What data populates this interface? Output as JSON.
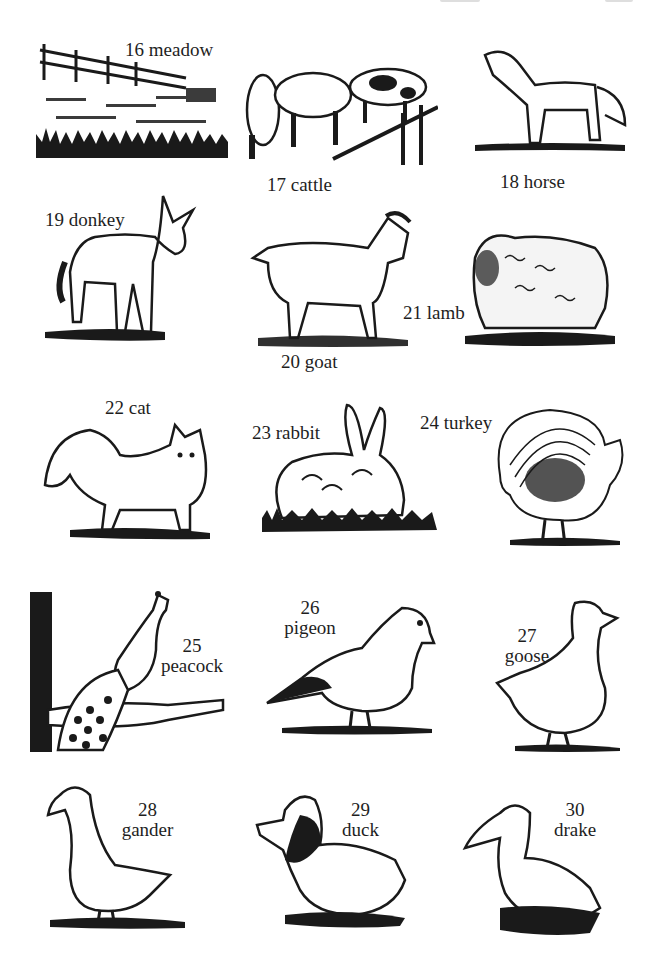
{
  "page": {
    "type": "picture dictionary page",
    "ink_color": "#1a1a1a",
    "paper_color": "#ffffff"
  },
  "items": [
    {
      "number": "16",
      "word": "meadow",
      "label": "16 meadow"
    },
    {
      "number": "17",
      "word": "cattle",
      "label": "17 cattle"
    },
    {
      "number": "18",
      "word": "horse",
      "label": "18 horse"
    },
    {
      "number": "19",
      "word": "donkey",
      "label": "19 donkey"
    },
    {
      "number": "20",
      "word": "goat",
      "label": "20 goat"
    },
    {
      "number": "21",
      "word": "lamb",
      "label": "21 lamb"
    },
    {
      "number": "22",
      "word": "cat",
      "label": "22 cat"
    },
    {
      "number": "23",
      "word": "rabbit",
      "label": "23 rabbit"
    },
    {
      "number": "24",
      "word": "turkey",
      "label": "24 turkey"
    },
    {
      "number": "25",
      "word": "peacock",
      "label": "25 peacock"
    },
    {
      "number": "26",
      "word": "pigeon",
      "label": "26 pigeon"
    },
    {
      "number": "27",
      "word": "goose",
      "label": "27 goose"
    },
    {
      "number": "28",
      "word": "gander",
      "label": "28 gander"
    },
    {
      "number": "29",
      "word": "duck",
      "label": "29 duck"
    },
    {
      "number": "30",
      "word": "drake",
      "label": "30 drake"
    }
  ]
}
